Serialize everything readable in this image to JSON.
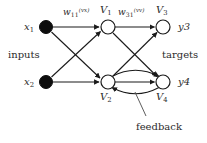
{
  "diagram": {
    "colors": {
      "background": "#ffffff",
      "stroke": "#1a1a1a",
      "input_node_fill": "#0d0d0d",
      "hidden_node_fill": "#ffffff",
      "text": "#2b2b2b"
    },
    "inputs": {
      "group_label": "inputs",
      "nodes": [
        {
          "label": "x",
          "subscript": "1",
          "x": 46,
          "y": 27,
          "r": 6.5,
          "filled": true
        },
        {
          "label": "x",
          "subscript": "2",
          "x": 46,
          "y": 82,
          "r": 6.5,
          "filled": true
        }
      ]
    },
    "hidden": {
      "nodes": [
        {
          "label": "V",
          "subscript": "1",
          "x": 108,
          "y": 27,
          "r": 7,
          "filled": false
        },
        {
          "label": "V",
          "subscript": "2",
          "x": 108,
          "y": 82,
          "r": 7,
          "filled": false
        }
      ]
    },
    "outputs": {
      "group_label": "targets",
      "nodes": [
        {
          "label": "V",
          "subscript": "3",
          "x": 163,
          "y": 27,
          "r": 7,
          "filled": false
        },
        {
          "label": "V",
          "subscript": "4",
          "x": 163,
          "y": 82,
          "r": 7,
          "filled": false
        }
      ],
      "target_labels": [
        {
          "text": "y3"
        },
        {
          "text": "y4"
        }
      ]
    },
    "weights": [
      {
        "symbol": "w",
        "subscript": "11",
        "superscript": "(vx)"
      },
      {
        "symbol": "w",
        "subscript": "31",
        "superscript": "(vv)"
      }
    ],
    "annotations": {
      "feedback": "feedback"
    },
    "edges": [
      {
        "from": "x1",
        "to": "V1"
      },
      {
        "from": "x1",
        "to": "V2"
      },
      {
        "from": "x2",
        "to": "V1"
      },
      {
        "from": "x2",
        "to": "V2"
      },
      {
        "from": "V1",
        "to": "V3"
      },
      {
        "from": "V1",
        "to": "V4"
      },
      {
        "from": "V2",
        "to": "V3"
      },
      {
        "from": "V2",
        "to": "V4"
      },
      {
        "from": "V2",
        "to": "V4",
        "style": "curved-feedback"
      },
      {
        "from": "V4",
        "to": "V2",
        "style": "curved-feedback"
      }
    ]
  }
}
